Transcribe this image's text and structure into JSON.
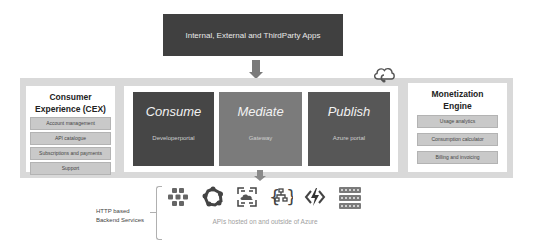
{
  "top": {
    "title": "Internal, External and ThirdParty Apps"
  },
  "consumer_experience": {
    "title_line1": "Consumer",
    "title_line2": "Experience (CEX)",
    "items": [
      "Account management",
      "API catalogue",
      "Subscriptions and payments",
      "Support"
    ]
  },
  "stages": [
    {
      "title": "Consume",
      "subtitle": "Developerportal",
      "color": "#464646"
    },
    {
      "title": "Mediate",
      "subtitle": "Gateway",
      "color": "#7b7b7b"
    },
    {
      "title": "Publish",
      "subtitle": "Azure portal",
      "color": "#575757"
    }
  ],
  "monetization": {
    "title_line1": "Monetization",
    "title_line2": "Engine",
    "items": [
      "Usage analytics",
      "Consumption calculator",
      "Billing and invoicing"
    ]
  },
  "backend": {
    "label_line1": "HTTP based",
    "label_line2": "Backend Services",
    "caption": "APIs hosted on and outside of Azure",
    "icons": [
      "service-fabric-icon",
      "kubernetes-icon",
      "app-service-icon",
      "logic-app-icon",
      "function-icon",
      "server-icon"
    ]
  },
  "colors": {
    "dark_box": "#404040",
    "panel_bg": "#d9d9d9",
    "pill_bg": "#c9c9c9"
  }
}
